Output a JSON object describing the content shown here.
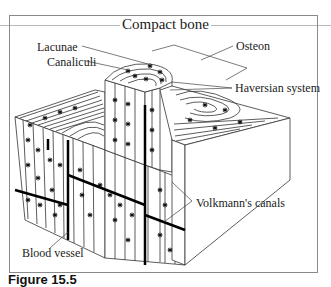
{
  "figure": {
    "title": "Compact bone",
    "labels": {
      "lacunae": "Lacunae",
      "canaliculi": "Canaliculi",
      "osteon": "Osteon",
      "haversian_system": "Haversian system",
      "volkmanns_canals": "Volkmann's canals",
      "blood_vessel": "Blood vessel"
    },
    "caption": {
      "number": "Figure 15.5",
      "text": "The structure of compact bone (partially visible)"
    },
    "colors": {
      "ink": "#222222",
      "frame": "#8a8a8a",
      "rule": "#b8b8b8",
      "background": "#ffffff"
    }
  }
}
